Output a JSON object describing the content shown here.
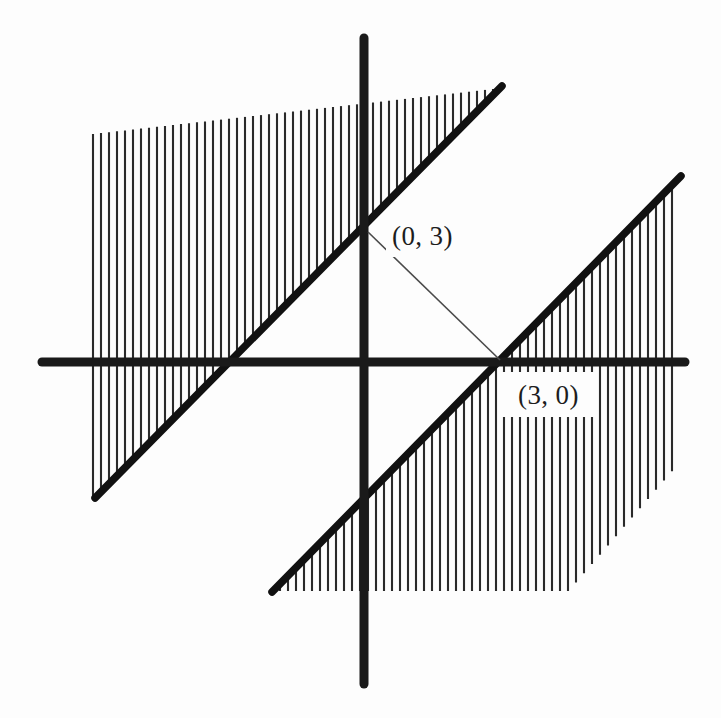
{
  "figure": {
    "background_color": "#fdfdfd",
    "axis_color": "#1a1a1a",
    "line_color": "#111111",
    "hatch_color": "#2a2a2a",
    "connector_color": "#4a4a4a"
  },
  "labels": {
    "point_a": "(0, 3)",
    "point_b": "(3, 0)"
  },
  "chart_data": {
    "type": "line",
    "xlabel": "",
    "ylabel": "",
    "grid": false,
    "legend": "none",
    "axes": {
      "origin_px": [
        363,
        362
      ],
      "x_axis_px": {
        "x1": 42,
        "y1": 362,
        "x2": 685,
        "y2": 362
      },
      "y_axis_px": {
        "x1": 364,
        "y1": 38,
        "x2": 364,
        "y2": 684
      },
      "unit_px": 43
    },
    "series": [
      {
        "name": "boundary-line-upper",
        "equation": "y = x + 3",
        "slope": 1,
        "intercept": 3,
        "endpoints_px": [
          [
            95,
            498
          ],
          [
            502,
            86
          ]
        ],
        "x_intercept": -3,
        "y_intercept": 3,
        "shaded_side": "above"
      },
      {
        "name": "boundary-line-lower",
        "equation": "y = x - 3",
        "slope": 1,
        "intercept": -3,
        "endpoints_px": [
          [
            272,
            592
          ],
          [
            681,
            176
          ]
        ],
        "x_intercept": 3,
        "y_intercept": -3,
        "shaded_side": "below"
      },
      {
        "name": "connector-segment",
        "endpoints_px": [
          [
            368,
            232
          ],
          [
            500,
            360
          ]
        ],
        "from_point": "(0, 3)",
        "to_point": "(3, 0)"
      }
    ],
    "annotations": [
      {
        "text": "(0, 3)",
        "anchor_px": [
          368,
          232
        ],
        "label_px": [
          392,
          245
        ],
        "point": [
          0,
          3
        ]
      },
      {
        "text": "(3, 0)",
        "anchor_px": [
          500,
          360
        ],
        "label_px": [
          518,
          404
        ],
        "point": [
          3,
          0
        ]
      }
    ],
    "shaded_regions": [
      {
        "name": "upper-left-region",
        "description": "vertical hatching above the line y = x + 3",
        "hatch": "vertical",
        "hatch_spacing_px": 8,
        "bounds_px": {
          "left": 93,
          "top_left_y": 134,
          "top_right_y": 88,
          "right": 502
        }
      },
      {
        "name": "lower-right-region",
        "description": "vertical hatching below the line y = x - 3",
        "hatch": "vertical",
        "hatch_spacing_px": 8,
        "bounds_px": {
          "left": 272,
          "right": 673,
          "bottom_left_y": 591,
          "bottom_right_y": 470
        }
      }
    ]
  }
}
